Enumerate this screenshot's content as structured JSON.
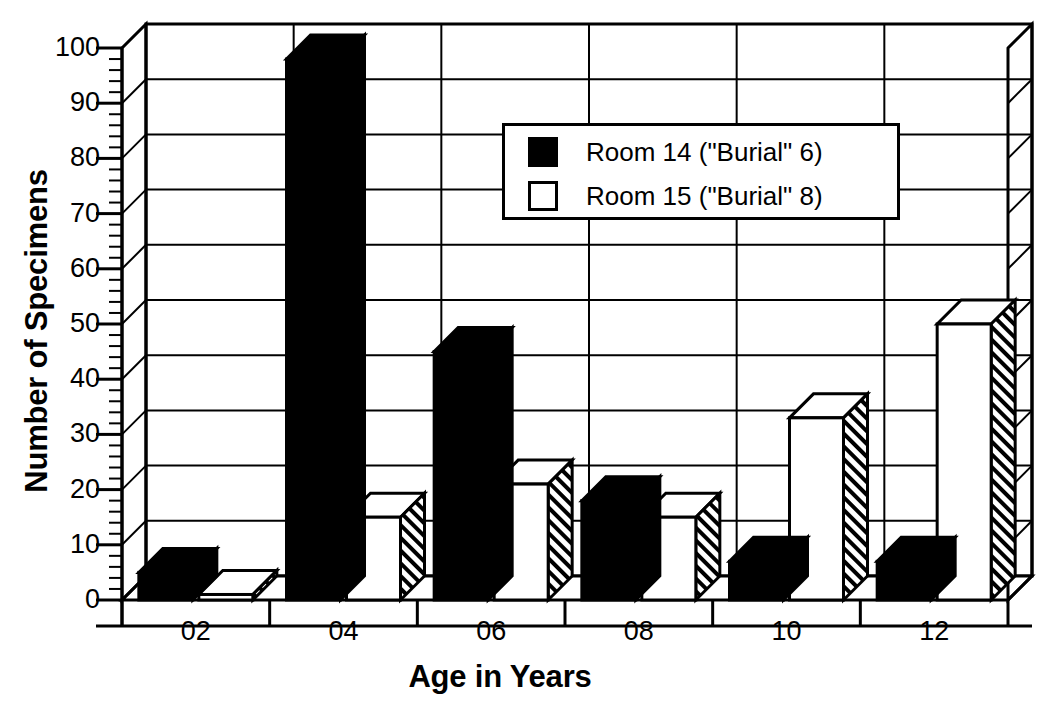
{
  "chart_data": {
    "type": "bar",
    "title": "",
    "subtitle": "",
    "xlabel": "Age in Years",
    "ylabel": "Number of Specimens",
    "categories": [
      "02",
      "04",
      "06",
      "08",
      "10",
      "12"
    ],
    "series": [
      {
        "name": "Room 14 (\"Burial\" 6)",
        "color": "#000000",
        "fill": "solid-black",
        "values": [
          5,
          98,
          45,
          18,
          7,
          7
        ]
      },
      {
        "name": "Room 15 (\"Burial\" 8)",
        "color": "#ffffff",
        "fill": "white-outline",
        "values": [
          1,
          15,
          21,
          15,
          33,
          50
        ]
      }
    ],
    "ylim": [
      0,
      100
    ],
    "ytick_step": 10,
    "yminor_step": 2,
    "yticks": [
      0,
      10,
      20,
      30,
      40,
      50,
      60,
      70,
      80,
      90,
      100
    ],
    "ytick_labels": [
      "0",
      "10",
      "20",
      "30",
      "40",
      "50",
      "60",
      "70",
      "80",
      "90",
      "100"
    ],
    "grid": "horizontal-and-vertical",
    "legend_position": "upper-center-right",
    "style": "3d-isometric-bars",
    "annotations": []
  },
  "legend": {
    "entries": [
      {
        "label": "Room 14 (\"Burial\" 6)",
        "swatch": "filled"
      },
      {
        "label": "Room 15 (\"Burial\" 8)",
        "swatch": "hollow"
      }
    ]
  },
  "axis": {
    "y_title": "Number of Specimens",
    "x_title": "Age in Years"
  }
}
